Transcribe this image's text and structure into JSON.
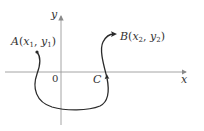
{
  "diagram": {
    "axes": {
      "x_label": "x",
      "y_label": "y",
      "origin_label": "0"
    },
    "curve": {
      "label": "C",
      "direction": "from A to B"
    },
    "points": [
      {
        "name": "A",
        "coord_x": "x",
        "coord_x_sub": "1",
        "coord_y": "y",
        "coord_y_sub": "1"
      },
      {
        "name": "B",
        "coord_x": "x",
        "coord_x_sub": "2",
        "coord_y": "y",
        "coord_y_sub": "2"
      }
    ],
    "colors": {
      "axis": "#8a8a8a",
      "curve": "#2a2a2a",
      "text": "#333333"
    }
  }
}
